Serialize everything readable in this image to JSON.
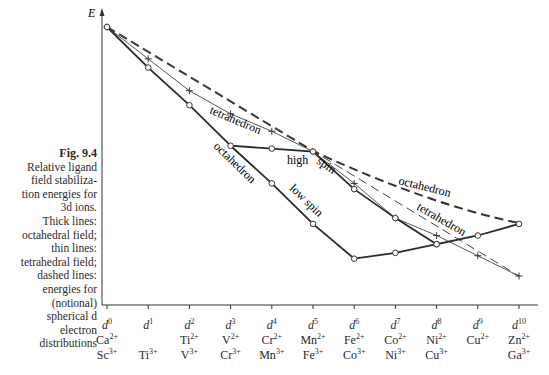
{
  "caption": {
    "title": "Fig. 9.4",
    "lines": [
      "Relative ligand",
      "field stabiliza-",
      "tion energies for",
      "3d ions.",
      "Thick lines:",
      "octahedral field;",
      "thin lines:",
      "tetrahedral field;",
      "dashed lines:",
      "energies for",
      "(notional)",
      "spherical d",
      "electron",
      "distributions"
    ]
  },
  "axis": {
    "ylabel": "E"
  },
  "labels": {
    "tetrahedron_thin": "tetrahedron",
    "octahedron_thick": "octahedron",
    "high_spin": "high spin",
    "low_spin": "low spin",
    "octahedron_dashed": "octahedron",
    "tetrahedron_dashed": "tetrahedron"
  },
  "categories": [
    {
      "d": "d",
      "n": "0",
      "ion2": "Ca",
      "ion3": "Sc"
    },
    {
      "d": "d",
      "n": "1",
      "ion2": "",
      "ion3": "Ti"
    },
    {
      "d": "d",
      "n": "2",
      "ion2": "Ti",
      "ion3": "V"
    },
    {
      "d": "d",
      "n": "3",
      "ion2": "V",
      "ion3": "Cr"
    },
    {
      "d": "d",
      "n": "4",
      "ion2": "Cr",
      "ion3": "Mn"
    },
    {
      "d": "d",
      "n": "5",
      "ion2": "Mn",
      "ion3": "Fe"
    },
    {
      "d": "d",
      "n": "6",
      "ion2": "Fe",
      "ion3": "Co"
    },
    {
      "d": "d",
      "n": "7",
      "ion2": "Co",
      "ion3": "Ni"
    },
    {
      "d": "d",
      "n": "8",
      "ion2": "Ni",
      "ion3": "Cu"
    },
    {
      "d": "d",
      "n": "9",
      "ion2": "Cu",
      "ion3": ""
    },
    {
      "d": "d",
      "n": "10",
      "ion2": "Zn",
      "ion3": "Ga"
    }
  ],
  "charges": {
    "two": "2+",
    "three": "3+"
  },
  "chart_data": {
    "type": "line",
    "xlabel": "",
    "ylabel": "E",
    "x": [
      "d0",
      "d1",
      "d2",
      "d3",
      "d4",
      "d5",
      "d6",
      "d7",
      "d8",
      "d9",
      "d10"
    ],
    "ylim": [
      0,
      100
    ],
    "grid": false,
    "note": "Values are relative energies estimated from pixel positions (higher = less stable); axis has no numeric ticks.",
    "series": [
      {
        "name": "octahedral high spin (thick)",
        "style": "thick-solid-circle",
        "values": [
          96,
          82,
          69,
          55,
          54,
          53,
          40,
          30,
          21,
          24,
          28
        ]
      },
      {
        "name": "octahedral low spin (thick)",
        "style": "thick-solid-circle",
        "x": [
          "d3",
          "d4",
          "d5",
          "d6",
          "d7",
          "d8"
        ],
        "values": [
          55,
          42,
          28,
          16,
          18,
          21
        ]
      },
      {
        "name": "tetrahedral (thin)",
        "style": "thin-solid-plus",
        "values": [
          96,
          85,
          74,
          66,
          60,
          53,
          42,
          30,
          24,
          17,
          10
        ]
      },
      {
        "name": "spherical reference, octahedron (dashed)",
        "style": "thick-dashed",
        "values": [
          96,
          null,
          null,
          null,
          null,
          53,
          null,
          null,
          null,
          null,
          28
        ]
      },
      {
        "name": "spherical reference, tetrahedron (dashed)",
        "style": "thin-dashed",
        "values": [
          96,
          null,
          null,
          null,
          null,
          53,
          null,
          null,
          null,
          null,
          10
        ]
      }
    ]
  }
}
